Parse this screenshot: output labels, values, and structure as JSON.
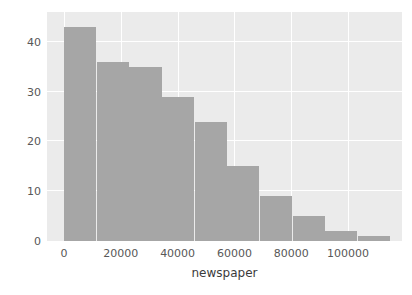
{
  "chart_data": {
    "type": "bar",
    "title": "",
    "subtitle": "",
    "xlabel": "newspaper",
    "ylabel": "",
    "xlim": [
      -6000,
      119000
    ],
    "ylim": [
      0,
      46
    ],
    "grid": true,
    "legend": false,
    "legend_position": "none",
    "bin_width": 11500,
    "bin_edges": [
      0,
      11500,
      23000,
      34500,
      46000,
      57500,
      69000,
      80500,
      92000,
      103500,
      115000
    ],
    "categories": [
      "0-11500",
      "11500-23000",
      "23000-34500",
      "34500-46000",
      "46000-57500",
      "57500-69000",
      "69000-80500",
      "80500-92000",
      "92000-103500",
      "103500-115000"
    ],
    "values": [
      43,
      36,
      35,
      29,
      24,
      15,
      9,
      5,
      2,
      1
    ],
    "bar_color": "#a6a6a6",
    "plot_background": "#ebebeb",
    "grid_color": "#ffffff",
    "figure_background": "#ffffff",
    "xticks": [
      {
        "value": 0,
        "label": "0"
      },
      {
        "value": 20000,
        "label": "20000"
      },
      {
        "value": 40000,
        "label": "40000"
      },
      {
        "value": 60000,
        "label": "60000"
      },
      {
        "value": 80000,
        "label": "80000"
      },
      {
        "value": 100000,
        "label": "100000"
      }
    ],
    "yticks": [
      {
        "value": 0,
        "label": "0"
      },
      {
        "value": 10,
        "label": "10"
      },
      {
        "value": 20,
        "label": "20"
      },
      {
        "value": 30,
        "label": "30"
      },
      {
        "value": 40,
        "label": "40"
      }
    ],
    "xgridlines": [
      0,
      20000,
      40000,
      60000,
      80000,
      100000
    ],
    "ygridlines": [
      10,
      20,
      30,
      40
    ],
    "tick_label_color": "#585858",
    "axis_label_color": "#3b3b3b"
  }
}
